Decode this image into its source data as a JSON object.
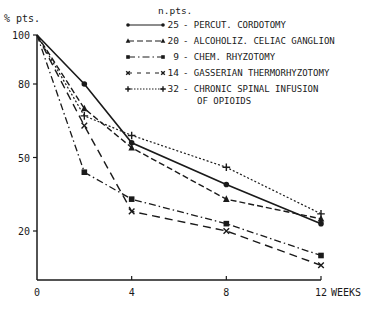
{
  "chart_data": {
    "type": "line",
    "title": "",
    "ylabel": "% pts.",
    "xlabel": "WEEKS",
    "x": [
      0,
      2,
      4,
      8,
      12
    ],
    "xticks": [
      0,
      4,
      8,
      12
    ],
    "yticks": [
      20,
      50,
      80,
      100
    ],
    "xlim": [
      0,
      12
    ],
    "ylim": [
      0,
      100
    ],
    "grid": false,
    "legend_title": "n.pts.",
    "legend_position": "top-right",
    "series": [
      {
        "name": "PERCUT. CORDOTOMY",
        "n": "25",
        "marker": "circle",
        "dash": "solid",
        "values": [
          100,
          80,
          56,
          39,
          23
        ]
      },
      {
        "name": "ALCOHOLIZ. CELIAC GANGLION",
        "n": "20",
        "marker": "triangle",
        "dash": "dashed",
        "values": [
          100,
          70,
          54,
          33,
          25
        ]
      },
      {
        "name": "CHEM. RHYZOTOMY",
        "n": "9",
        "marker": "square",
        "dash": "dashdot",
        "values": [
          100,
          44,
          33,
          23,
          10
        ]
      },
      {
        "name": "GASSERIAN THERMORHYZOTOMY",
        "n": "14",
        "marker": "x",
        "dash": "longdash",
        "values": [
          100,
          63,
          28,
          20,
          6
        ]
      },
      {
        "name": "CHRONIC SPINAL INFUSION OF OPIOIDS",
        "n": "32",
        "marker": "plus",
        "dash": "dotted",
        "values": [
          100,
          67,
          59,
          46,
          27
        ]
      }
    ]
  },
  "legend": {
    "title": "n.pts.",
    "items": [
      {
        "count": "25",
        "label": "- PERCUT. CORDOTOMY"
      },
      {
        "count": "20",
        "label": "- ALCOHOLIZ. CELIAC GANGLION"
      },
      {
        "count": "9",
        "label": "- CHEM. RHYZOTOMY"
      },
      {
        "count": "14",
        "label": "- GASSERIAN THERMORHYZOTOMY"
      },
      {
        "count": "32",
        "label": "- CHRONIC SPINAL INFUSION",
        "label2": "OF OPIOIDS"
      }
    ]
  },
  "axes": {
    "y_title": "% pts.",
    "x_title": "WEEKS",
    "y_tick_labels": [
      "100",
      "80",
      "50",
      "20"
    ],
    "x_tick_labels": [
      "0",
      "4",
      "8",
      "12"
    ]
  }
}
